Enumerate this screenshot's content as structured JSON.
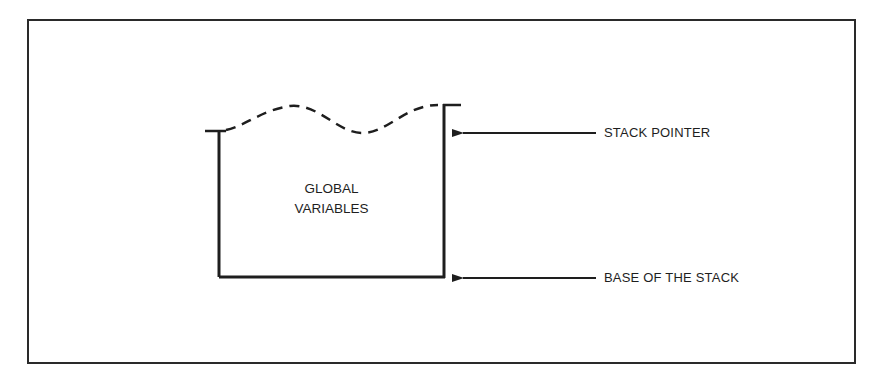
{
  "diagram": {
    "type": "stack-memory-diagram",
    "box": {
      "lines": [
        "GLOBAL",
        "VARIABLES"
      ],
      "top_edge_style": "dashed-wavy"
    },
    "pointers": [
      {
        "id": "stack-pointer",
        "label": "STACK POINTER",
        "target": "top of stack"
      },
      {
        "id": "base-of-stack",
        "label": "BASE OF THE STACK",
        "target": "bottom of stack"
      }
    ],
    "colors": {
      "ink": "#1e1e1e",
      "background": "#ffffff"
    }
  }
}
